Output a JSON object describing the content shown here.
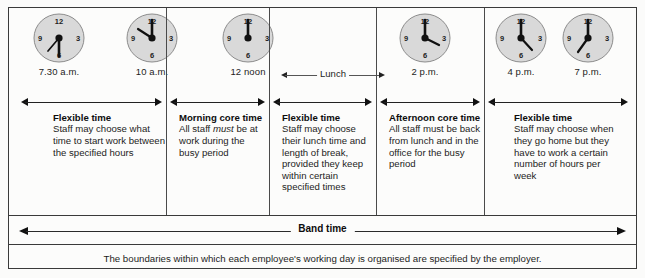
{
  "clocks": [
    {
      "name": "clock-730am",
      "label": "7.30 a.m.",
      "hour_deg": 225,
      "minute_deg": 180,
      "numerals": [
        "12",
        "3",
        "6",
        "9"
      ]
    },
    {
      "name": "clock-10am",
      "label": "10 a.m.",
      "hour_deg": 300,
      "minute_deg": 0,
      "numerals": [
        "12",
        "3",
        "6",
        "9"
      ]
    },
    {
      "name": "clock-12noon",
      "label": "12 noon",
      "hour_deg": 0,
      "minute_deg": 0,
      "numerals": [
        "12",
        "3",
        "6",
        "9"
      ]
    },
    {
      "name": "clock-2pm",
      "label": "2 p.m.",
      "hour_deg": 60,
      "minute_deg": 0,
      "numerals": [
        "12",
        "3",
        "6",
        "9"
      ]
    },
    {
      "name": "clock-4pm",
      "label": "4 p.m.",
      "hour_deg": 120,
      "minute_deg": 0,
      "numerals": [
        "12",
        "3",
        "6",
        "9"
      ]
    },
    {
      "name": "clock-7pm",
      "label": "7 p.m.",
      "hour_deg": 210,
      "minute_deg": 0,
      "numerals": [
        "12",
        "3",
        "6",
        "9"
      ]
    }
  ],
  "lunch": {
    "label": "Lunch"
  },
  "panels": [
    {
      "name": "panel-flexible-morning",
      "title": "Flexible time",
      "body": "Staff may choose what time to start work between the specified hours"
    },
    {
      "name": "panel-morning-core",
      "title": "Morning core time",
      "body_pre": "All staff ",
      "body_em": "must",
      "body_post": " be at work during the busy period"
    },
    {
      "name": "panel-flexible-lunch",
      "title": "Flexible time",
      "body": "Staff may choose their lunch time and length of break, provided they keep within certain specified times"
    },
    {
      "name": "panel-afternoon-core",
      "title": "Afternoon core time",
      "body": "All staff must be back from lunch and in the office for the busy period"
    },
    {
      "name": "panel-flexible-evening",
      "title": "Flexible time",
      "body": "Staff may choose when they go home but they have to work a certain number of hours per week"
    }
  ],
  "band": {
    "label": "Band time"
  },
  "footer": {
    "text": "The boundaries within which each employee's working day is organised are specified by the employer."
  },
  "colors": {
    "ink": "#1c1c1c",
    "rule": "#3a3a3a",
    "clock_face": "#d9d9d9",
    "clock_rim": "#8c8c8c",
    "page": "#fcfcfb"
  }
}
